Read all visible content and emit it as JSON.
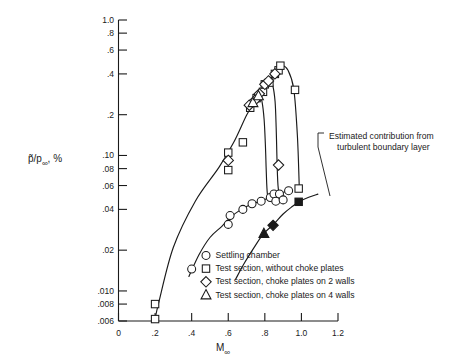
{
  "chart_data": {
    "type": "scatter",
    "title": "",
    "xlabel": "M∞",
    "ylabel": "p̃/p∞, %",
    "yscale": "log",
    "xlim": [
      0,
      1.2
    ],
    "ylim": [
      0.006,
      1.0
    ],
    "grid": false,
    "legend_position": "bottom-right",
    "x_ticks": [
      "0",
      ".2",
      ".4",
      ".6",
      ".8",
      "1.0",
      "1.2"
    ],
    "x_tick_values": [
      0,
      0.2,
      0.4,
      0.6,
      0.8,
      1.0,
      1.2
    ],
    "y_ticks": [
      "1.0",
      ".8",
      ".6",
      ".4",
      ".2",
      ".10",
      ".08",
      ".06",
      ".04",
      ".02",
      ".010",
      ".008",
      ".006"
    ],
    "y_tick_values": [
      1.0,
      0.8,
      0.6,
      0.4,
      0.2,
      0.1,
      0.08,
      0.06,
      0.04,
      0.02,
      0.01,
      0.008,
      0.006
    ],
    "series": [
      {
        "name": "Settling chamber",
        "symbol": "circle",
        "filled": false,
        "points": [
          {
            "x": 0.4,
            "y": 0.0145
          },
          {
            "x": 0.6,
            "y": 0.031
          },
          {
            "x": 0.61,
            "y": 0.036
          },
          {
            "x": 0.68,
            "y": 0.04
          },
          {
            "x": 0.73,
            "y": 0.044
          },
          {
            "x": 0.78,
            "y": 0.046
          },
          {
            "x": 0.83,
            "y": 0.049
          },
          {
            "x": 0.85,
            "y": 0.052
          },
          {
            "x": 0.88,
            "y": 0.052
          },
          {
            "x": 0.93,
            "y": 0.055
          },
          {
            "x": 0.86,
            "y": 0.046
          },
          {
            "x": 0.9,
            "y": 0.047
          }
        ]
      },
      {
        "name": "Test section, without choke plates",
        "symbol": "square",
        "filled": false,
        "points": [
          {
            "x": 0.2,
            "y": 0.008
          },
          {
            "x": 0.2,
            "y": 0.0062
          },
          {
            "x": 0.6,
            "y": 0.105
          },
          {
            "x": 0.6,
            "y": 0.078
          },
          {
            "x": 0.68,
            "y": 0.125
          },
          {
            "x": 0.72,
            "y": 0.225
          },
          {
            "x": 0.755,
            "y": 0.265
          },
          {
            "x": 0.79,
            "y": 0.295
          },
          {
            "x": 0.8,
            "y": 0.335
          },
          {
            "x": 0.825,
            "y": 0.345
          },
          {
            "x": 0.855,
            "y": 0.4
          },
          {
            "x": 0.875,
            "y": 0.425
          },
          {
            "x": 0.885,
            "y": 0.46
          },
          {
            "x": 0.965,
            "y": 0.305
          },
          {
            "x": 0.985,
            "y": 0.057
          }
        ]
      },
      {
        "name": "Test section, choke plates on 2 walls",
        "symbol": "diamond",
        "filled": false,
        "points": [
          {
            "x": 0.6,
            "y": 0.092
          },
          {
            "x": 0.715,
            "y": 0.235
          },
          {
            "x": 0.745,
            "y": 0.255
          },
          {
            "x": 0.77,
            "y": 0.285
          },
          {
            "x": 0.8,
            "y": 0.335
          },
          {
            "x": 0.82,
            "y": 0.355
          },
          {
            "x": 0.855,
            "y": 0.4
          },
          {
            "x": 0.875,
            "y": 0.085
          }
        ]
      },
      {
        "name": "Test section, choke plates on 4 walls",
        "symbol": "triangle",
        "filled": false,
        "points": [
          {
            "x": 0.735,
            "y": 0.245
          },
          {
            "x": 0.765,
            "y": 0.275
          }
        ]
      },
      {
        "name": "Estimated contribution from turbulent boundary layer",
        "symbol": "mixed-filled",
        "filled": true,
        "points": [
          {
            "x": 0.795,
            "y": 0.0265,
            "symbol": "triangle"
          },
          {
            "x": 0.845,
            "y": 0.0305,
            "symbol": "diamond"
          },
          {
            "x": 0.985,
            "y": 0.0455,
            "symbol": "square"
          }
        ]
      }
    ],
    "annotations": [
      {
        "text_line1": "Estimated contribution from",
        "text_line2": "turbulent boundary layer",
        "points_to": {
          "x": 0.92,
          "y": 0.037
        }
      }
    ],
    "legend": [
      {
        "symbol": "circle",
        "label": "Settling chamber"
      },
      {
        "symbol": "square",
        "label": "Test section, without choke plates"
      },
      {
        "symbol": "diamond",
        "label": "Test section, choke plates on 2 walls"
      },
      {
        "symbol": "triangle",
        "label": "Test section, choke plates on 4 walls"
      }
    ]
  },
  "colors": {
    "ink": "#1a1a1a",
    "background": "#ffffff",
    "marker_fill": "#ffffff"
  }
}
